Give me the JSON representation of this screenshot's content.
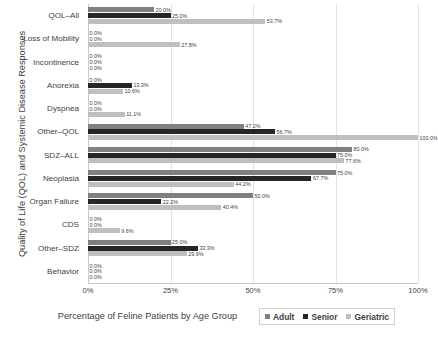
{
  "chart_data": {
    "type": "bar",
    "orientation": "horizontal",
    "title": "",
    "xlabel": "Percentage of Feline Patients by Age Group",
    "ylabel": "Quality of Life (QOL) and Systemic Disease Responses",
    "xlim": [
      0,
      100
    ],
    "xticks": [
      "0%",
      "25%",
      "50%",
      "75%",
      "100%"
    ],
    "xtick_values": [
      0,
      25,
      50,
      75,
      100
    ],
    "grid": true,
    "legend_position": "bottom-right",
    "value_label_suffix": "%",
    "categories": [
      "QOL–All",
      "Loss of Mobility",
      "Incontinence",
      "Anorexia",
      "Dyspnea",
      "Other–QOL",
      "SDZ–ALL",
      "Neoplasia",
      "Organ Failure",
      "CDS",
      "Other–SDZ",
      "Behavior"
    ],
    "series": [
      {
        "name": "Adult",
        "color": "#808080",
        "values": [
          20.0,
          0.0,
          0.0,
          0.0,
          0.0,
          47.2,
          80.0,
          75.0,
          50.0,
          0.0,
          25.0,
          0.0
        ],
        "labels": [
          "20.0%",
          "0.0%",
          "0.0%",
          "0.0%",
          "0.0%",
          "47.2%",
          "80.0%",
          "75.0%",
          "50.0%",
          "0.0%",
          "25.0%",
          "0.0%"
        ]
      },
      {
        "name": "Senior",
        "color": "#262626",
        "values": [
          25.0,
          0.0,
          0.0,
          13.3,
          0.0,
          56.7,
          75.0,
          67.7,
          22.2,
          0.0,
          33.3,
          0.0
        ],
        "labels": [
          "25.0%",
          "0.0%",
          "0.0%",
          "13.3%",
          "0.0%",
          "56.7%",
          "75.0%",
          "67.7%",
          "22.2%",
          "0.0%",
          "33.3%",
          "0.0%"
        ]
      },
      {
        "name": "Geriatric",
        "color": "#bfbfbf",
        "values": [
          53.7,
          27.8,
          0.0,
          10.6,
          11.1,
          100.0,
          77.6,
          44.2,
          40.4,
          9.6,
          29.9,
          0.0
        ],
        "labels": [
          "53.7%",
          "27.8%",
          "0.0%",
          "10.6%",
          "11.1%",
          "100.0%",
          "77.6%",
          "44.2%",
          "40.4%",
          "9.6%",
          "29.9%",
          "0.0%"
        ]
      }
    ]
  }
}
